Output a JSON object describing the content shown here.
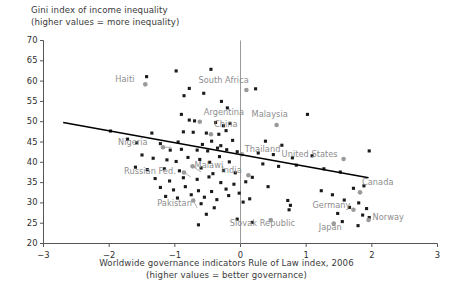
{
  "title": {
    "line1": "Gini index of income inequality",
    "line2": "(higher values = more inequality)"
  },
  "xaxis": {
    "label_line1": "Worldwide governance indicators Rule of Law index, 2006",
    "label_line2": "(higher values = better governance)",
    "ticks": [
      "-3",
      "-2",
      "-1",
      "0",
      "1",
      "2",
      "3"
    ]
  },
  "yaxis": {
    "ticks": [
      "70",
      "65",
      "60",
      "55",
      "50",
      "45",
      "40",
      "35",
      "30",
      "25",
      "20"
    ]
  },
  "colors": {
    "marker": "#1a1a1a",
    "highlight_marker": "#9a9a9a",
    "label_text": "#8d8d8d",
    "axis": "#555555",
    "trendline": "#000000",
    "background": "#ffffff",
    "zeroline": "#9a9a9a"
  },
  "chart_data": {
    "type": "scatter",
    "title": "Gini index of income inequality (higher values = more inequality)",
    "xlabel": "Worldwide governance indicators Rule of Law index, 2006 (higher values = better governance)",
    "ylabel": "Gini index of income inequality",
    "xlim": [
      -3,
      3
    ],
    "ylim": [
      20,
      70
    ],
    "grid": false,
    "legend": null,
    "zero_reference_line_x": 0,
    "trendline": {
      "type": "linear",
      "x_start": -2.7,
      "y_start": 49.8,
      "x_end": 1.95,
      "y_end": 36.2
    },
    "labeled_points": [
      {
        "name": "Haiti",
        "x": -1.45,
        "y": 59.2
      },
      {
        "name": "Argentina",
        "x": -0.62,
        "y": 50.0
      },
      {
        "name": "South Africa",
        "x": 0.09,
        "y": 57.8
      },
      {
        "name": "Malaysia",
        "x": 0.55,
        "y": 49.2
      },
      {
        "name": "China",
        "x": -0.45,
        "y": 46.9
      },
      {
        "name": "Thailand",
        "x": 0.02,
        "y": 42.0
      },
      {
        "name": "United States",
        "x": 1.57,
        "y": 40.8
      },
      {
        "name": "Nigeria",
        "x": -1.18,
        "y": 43.7
      },
      {
        "name": "Malawi",
        "x": -0.73,
        "y": 39.0
      },
      {
        "name": "Russian Fed.",
        "x": -0.86,
        "y": 37.5
      },
      {
        "name": "India",
        "x": 0.12,
        "y": 36.8
      },
      {
        "name": "Canada",
        "x": 1.82,
        "y": 32.6
      },
      {
        "name": "Pakistan",
        "x": -0.72,
        "y": 30.6
      },
      {
        "name": "Slovak Republic",
        "x": 0.46,
        "y": 25.8
      },
      {
        "name": "Germany",
        "x": 1.72,
        "y": 28.3
      },
      {
        "name": "Japan",
        "x": 1.42,
        "y": 24.9
      },
      {
        "name": "Norway",
        "x": 1.95,
        "y": 25.8
      }
    ],
    "unlabeled_points": [
      {
        "x": -1.43,
        "y": 61.1
      },
      {
        "x": -0.98,
        "y": 62.5
      },
      {
        "x": -0.45,
        "y": 62.9
      },
      {
        "x": -0.78,
        "y": 58.2
      },
      {
        "x": -0.86,
        "y": 56.4
      },
      {
        "x": -0.56,
        "y": 57.0
      },
      {
        "x": -0.29,
        "y": 55.0
      },
      {
        "x": 0.23,
        "y": 58.1
      },
      {
        "x": -0.2,
        "y": 53.4
      },
      {
        "x": -0.9,
        "y": 51.8
      },
      {
        "x": -0.78,
        "y": 50.4
      },
      {
        "x": -0.7,
        "y": 50.2
      },
      {
        "x": -0.38,
        "y": 49.8
      },
      {
        "x": -0.26,
        "y": 49.0
      },
      {
        "x": -0.16,
        "y": 49.6
      },
      {
        "x": 1.02,
        "y": 51.8
      },
      {
        "x": -0.87,
        "y": 47.5
      },
      {
        "x": -0.72,
        "y": 47.4
      },
      {
        "x": -0.52,
        "y": 47.2
      },
      {
        "x": -0.33,
        "y": 46.9
      },
      {
        "x": -0.22,
        "y": 47.8
      },
      {
        "x": -1.98,
        "y": 47.7
      },
      {
        "x": -1.72,
        "y": 45.7
      },
      {
        "x": -1.58,
        "y": 44.8
      },
      {
        "x": -1.22,
        "y": 44.6
      },
      {
        "x": -0.95,
        "y": 45.0
      },
      {
        "x": -0.58,
        "y": 44.4
      },
      {
        "x": -0.44,
        "y": 45.2
      },
      {
        "x": -0.3,
        "y": 44.1
      },
      {
        "x": -0.12,
        "y": 45.4
      },
      {
        "x": 0.38,
        "y": 45.2
      },
      {
        "x": 0.63,
        "y": 44.2
      },
      {
        "x": -1.07,
        "y": 43.0
      },
      {
        "x": -0.9,
        "y": 43.2
      },
      {
        "x": -0.66,
        "y": 43.0
      },
      {
        "x": -0.5,
        "y": 42.8
      },
      {
        "x": -0.35,
        "y": 43.5
      },
      {
        "x": -0.21,
        "y": 43.1
      },
      {
        "x": -0.05,
        "y": 42.6
      },
      {
        "x": 0.27,
        "y": 42.3
      },
      {
        "x": 0.5,
        "y": 41.9
      },
      {
        "x": 0.79,
        "y": 41.1
      },
      {
        "x": 1.09,
        "y": 41.6
      },
      {
        "x": 1.96,
        "y": 42.8
      },
      {
        "x": -1.33,
        "y": 41.0
      },
      {
        "x": -1.12,
        "y": 40.6
      },
      {
        "x": -0.98,
        "y": 40.2
      },
      {
        "x": -0.8,
        "y": 41.2
      },
      {
        "x": -0.62,
        "y": 40.7
      },
      {
        "x": -0.47,
        "y": 40.0
      },
      {
        "x": -0.32,
        "y": 41.4
      },
      {
        "x": -0.17,
        "y": 40.1
      },
      {
        "x": 0.34,
        "y": 39.6
      },
      {
        "x": 0.58,
        "y": 39.0
      },
      {
        "x": 0.85,
        "y": 39.3
      },
      {
        "x": 1.27,
        "y": 38.4
      },
      {
        "x": 1.52,
        "y": 37.6
      },
      {
        "x": -1.6,
        "y": 38.8
      },
      {
        "x": -1.42,
        "y": 38.2
      },
      {
        "x": -1.16,
        "y": 38.4
      },
      {
        "x": -0.93,
        "y": 37.9
      },
      {
        "x": -0.6,
        "y": 38.6
      },
      {
        "x": -0.42,
        "y": 37.2
      },
      {
        "x": -0.26,
        "y": 38.0
      },
      {
        "x": -0.08,
        "y": 37.4
      },
      {
        "x": 0.18,
        "y": 36.3
      },
      {
        "x": 1.72,
        "y": 33.6
      },
      {
        "x": 1.88,
        "y": 34.2
      },
      {
        "x": -1.3,
        "y": 36.0
      },
      {
        "x": -1.08,
        "y": 35.4
      },
      {
        "x": -0.87,
        "y": 36.2
      },
      {
        "x": -0.66,
        "y": 35.8
      },
      {
        "x": -0.48,
        "y": 36.4
      },
      {
        "x": -0.3,
        "y": 35.0
      },
      {
        "x": -0.1,
        "y": 34.6
      },
      {
        "x": 0.08,
        "y": 35.2
      },
      {
        "x": 0.42,
        "y": 34.0
      },
      {
        "x": 1.23,
        "y": 33.0
      },
      {
        "x": 1.4,
        "y": 32.0
      },
      {
        "x": -1.22,
        "y": 33.8
      },
      {
        "x": -1.02,
        "y": 33.2
      },
      {
        "x": -0.84,
        "y": 34.0
      },
      {
        "x": -0.64,
        "y": 33.0
      },
      {
        "x": -0.44,
        "y": 32.8
      },
      {
        "x": -0.22,
        "y": 33.4
      },
      {
        "x": -0.02,
        "y": 32.4
      },
      {
        "x": 0.14,
        "y": 31.0
      },
      {
        "x": 1.58,
        "y": 30.7
      },
      {
        "x": 1.8,
        "y": 30.0
      },
      {
        "x": -1.14,
        "y": 31.6
      },
      {
        "x": -0.96,
        "y": 31.2
      },
      {
        "x": -0.75,
        "y": 32.0
      },
      {
        "x": -0.55,
        "y": 31.4
      },
      {
        "x": -0.36,
        "y": 30.8
      },
      {
        "x": -0.18,
        "y": 31.8
      },
      {
        "x": 0.04,
        "y": 30.2
      },
      {
        "x": 0.72,
        "y": 30.6
      },
      {
        "x": 0.76,
        "y": 29.4
      },
      {
        "x": 1.66,
        "y": 28.9
      },
      {
        "x": 1.92,
        "y": 28.6
      },
      {
        "x": -0.6,
        "y": 29.8
      },
      {
        "x": -0.4,
        "y": 28.8
      },
      {
        "x": -0.52,
        "y": 27.2
      },
      {
        "x": 0.74,
        "y": 28.3
      },
      {
        "x": 1.48,
        "y": 27.4
      },
      {
        "x": 1.86,
        "y": 27.0
      },
      {
        "x": 1.96,
        "y": 26.4
      },
      {
        "x": 1.55,
        "y": 25.4
      },
      {
        "x": 0.18,
        "y": 25.2
      },
      {
        "x": -0.05,
        "y": 26.0
      },
      {
        "x": -0.64,
        "y": 24.6
      },
      {
        "x": 1.79,
        "y": 24.4
      },
      {
        "x": -1.35,
        "y": 47.2
      },
      {
        "x": -1.5,
        "y": 41.8
      }
    ]
  }
}
